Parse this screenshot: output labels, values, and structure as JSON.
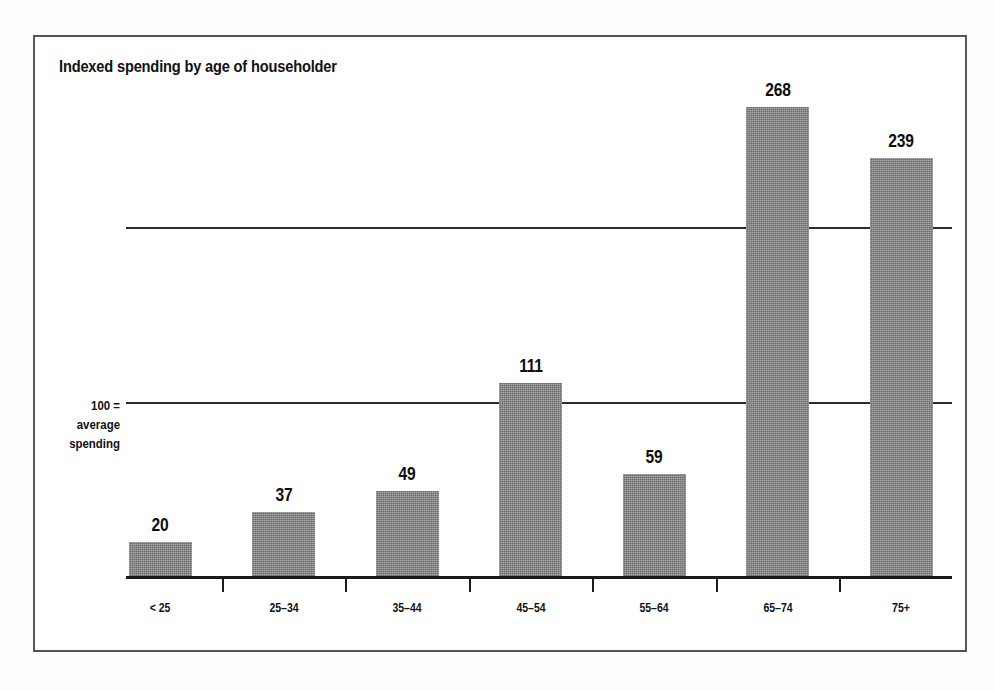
{
  "chart_data": {
    "type": "bar",
    "title": "Indexed spending by age of householder",
    "xlabel": "",
    "ylabel": "100 = average spending",
    "ylabel_lines": [
      "100 =",
      "average",
      "spending"
    ],
    "categories": [
      "< 25",
      "25–34",
      "35–44",
      "45–54",
      "55–64",
      "65–74",
      "75+"
    ],
    "values": [
      20,
      37,
      49,
      111,
      59,
      268,
      239
    ],
    "value_labels": [
      "20",
      "37",
      "49",
      "111",
      "59",
      "268",
      "239"
    ],
    "ylim": [
      0,
      290
    ],
    "gridlines": [
      100,
      200
    ],
    "grid": true,
    "legend": null,
    "bar_color": "#848484",
    "axis_color": "#1a1a1a",
    "frame_color": "#555555",
    "text_color": "#111111",
    "reference_value": 100,
    "reference_note": "100 = average spending"
  }
}
